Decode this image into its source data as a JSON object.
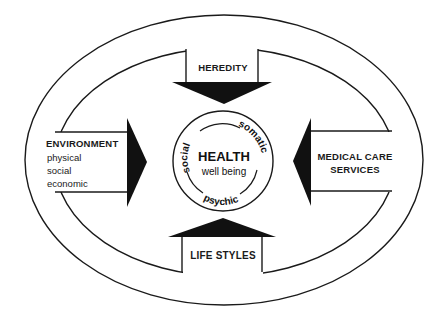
{
  "diagram": {
    "center": {
      "title": "HEALTH",
      "subtitle": "well being",
      "ring_labels": {
        "top_left": "social",
        "top_right": "somatic",
        "bottom": "psychic"
      }
    },
    "factors": {
      "top": {
        "label": "HEREDITY",
        "direction": "down"
      },
      "left": {
        "label": "ENVIRONMENT",
        "direction": "right",
        "sub_items": [
          "physical",
          "social",
          "economic"
        ]
      },
      "right": {
        "label_line1": "MEDICAL CARE",
        "label_line2": "SERVICES",
        "direction": "left"
      },
      "bottom": {
        "label": "LIFE STYLES",
        "direction": "up"
      }
    },
    "colors": {
      "ink": "#1a1a1a",
      "background": "#ffffff"
    }
  }
}
